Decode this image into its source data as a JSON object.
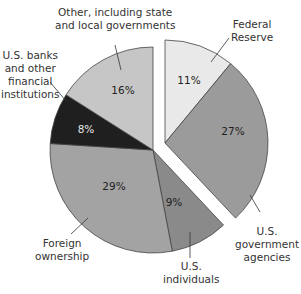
{
  "chart_data": {
    "type": "pie",
    "title": "",
    "start_angle_deg": 0,
    "direction": "clockwise",
    "exploded_group": [
      "Federal Reserve",
      "U.S. government agencies"
    ],
    "slices": [
      {
        "label": "Federal Reserve",
        "value": 11,
        "value_label": "11%",
        "color": "#e9e9e9"
      },
      {
        "label": "U.S. government agencies",
        "value": 27,
        "value_label": "27%",
        "color": "#9b9b9b"
      },
      {
        "label": "U.S. individuals",
        "value": 9,
        "value_label": "9%",
        "color": "#8a8a8a"
      },
      {
        "label": "Foreign ownership",
        "value": 29,
        "value_label": "29%",
        "color": "#a3a3a3"
      },
      {
        "label": "U.S. banks and other financial institutions",
        "value": 8,
        "value_label": "8%",
        "color": "#1f1f1f"
      },
      {
        "label": "Other, including state and local governments",
        "value": 16,
        "value_label": "16%",
        "color": "#c6c6c6"
      }
    ]
  },
  "labels": {
    "fed": [
      "Federal",
      "Reserve"
    ],
    "agencies": [
      "U.S.",
      "government",
      "agencies"
    ],
    "individuals": [
      "U.S.",
      "individuals"
    ],
    "foreign": [
      "Foreign",
      "ownership"
    ],
    "banks": [
      "U.S. banks",
      "and other",
      "financial",
      "institutions"
    ],
    "other": [
      "Other, including state",
      "and local governments"
    ]
  }
}
